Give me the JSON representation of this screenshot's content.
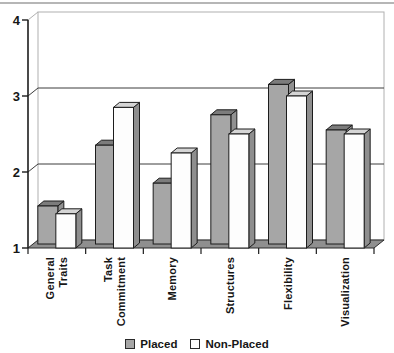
{
  "chart_data": {
    "type": "bar",
    "style": "3d-clustered-column",
    "categories": [
      "General\nTraits",
      "Task\nCommitment",
      "Memory",
      "Structures",
      "Flexibility",
      "Visualization"
    ],
    "series": [
      {
        "name": "Placed",
        "values": [
          1.5,
          2.3,
          1.8,
          2.7,
          3.1,
          2.5
        ],
        "front_color": "#a6a6a6",
        "top_color": "#7c7c7c",
        "side_color": "#919191"
      },
      {
        "name": "Non-Placed",
        "values": [
          1.45,
          2.85,
          2.25,
          2.5,
          3.0,
          2.5
        ],
        "front_color": "#fdfdfd",
        "top_color": "#d5d5d5",
        "side_color": "#8e8e8e"
      }
    ],
    "title": "",
    "xlabel": "",
    "ylabel": "",
    "ylim": [
      1,
      4
    ],
    "yticks": [
      1,
      2,
      3,
      4
    ],
    "grid": true,
    "legend_position": "bottom",
    "colors": {
      "gridline": "#3c3c3c",
      "wall_border": "#b0b0b0",
      "axis": "#1c1c1c",
      "floor": "#8f8f8f",
      "outline": "#1c1c1c"
    }
  }
}
